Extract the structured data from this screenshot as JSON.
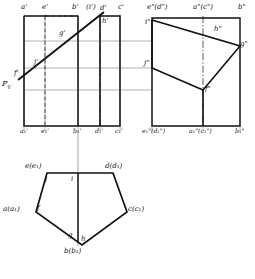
{
  "drawing": {
    "title": "Orthographic projection of a truncated pentagonal prism",
    "type": "engineering-drawing",
    "views": [
      "front-view",
      "side-view",
      "top-view"
    ],
    "line_color": "#111111",
    "thin_line_color": "#555555",
    "background": "#ffffff"
  },
  "front_view": {
    "name": "front-view",
    "top_labels": [
      "a'",
      "e'",
      "b'",
      "(i')",
      "d'",
      "c'"
    ],
    "bottom_labels": [
      "a₁'",
      "e₁'",
      "b₁'",
      "d₁'",
      "c₁'"
    ],
    "interior_labels": [
      "g'",
      "h'",
      "j'",
      "f'"
    ],
    "cutting_plane_label": "P",
    "cutting_plane_sub": "V"
  },
  "side_view": {
    "name": "side-view",
    "top_labels": [
      "e\"(d\")",
      "a\"(c\")",
      "b\""
    ],
    "bottom_labels": [
      "e₁\"(d₁\")",
      "a₁\"(c₁\")",
      "b₁\""
    ],
    "interior_labels": [
      "i\"",
      "h\"",
      "g\"",
      "j\"",
      "f\""
    ]
  },
  "top_view": {
    "name": "top-view",
    "vertex_labels": [
      "e(e₁)",
      "d(d₁)",
      "c(c₁)",
      "b(b₁)",
      "a(a₁)"
    ],
    "interior_labels": [
      "j",
      "i",
      "f",
      "g",
      "h"
    ]
  }
}
